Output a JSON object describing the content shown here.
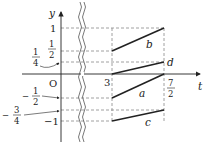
{
  "diagram": {
    "axes": {
      "x_label": "t",
      "y_label": "y",
      "origin_label": "O"
    },
    "x_ticks": [
      {
        "value": 3,
        "label": "3"
      },
      {
        "value": 3.5,
        "label_num": "7",
        "label_den": "2"
      }
    ],
    "y_ticks": [
      {
        "value": 1,
        "label": "1"
      },
      {
        "value": 0.5,
        "label_num": "1",
        "label_den": "2"
      },
      {
        "value": 0.25,
        "label_num": "1",
        "label_den": "4",
        "callout": true
      },
      {
        "value": -0.5,
        "label_sign": "−",
        "label_num": "1",
        "label_den": "2",
        "callout": true
      },
      {
        "value": -0.75,
        "label_sign": "−",
        "label_num": "3",
        "label_den": "4",
        "callout": true
      },
      {
        "value": -1,
        "label": "−1"
      }
    ],
    "segments": [
      {
        "name": "a",
        "from": [
          3,
          -0.5
        ],
        "to": [
          3.5,
          0
        ]
      },
      {
        "name": "b",
        "from": [
          3,
          0.5
        ],
        "to": [
          3.5,
          1
        ]
      },
      {
        "name": "c",
        "from": [
          3,
          -1
        ],
        "to": [
          3.5,
          -0.75
        ]
      },
      {
        "name": "d",
        "from": [
          3,
          0
        ],
        "to": [
          3.5,
          0.25
        ]
      }
    ],
    "axis_break": "wavy double line between 0 and 3 on t-axis"
  }
}
